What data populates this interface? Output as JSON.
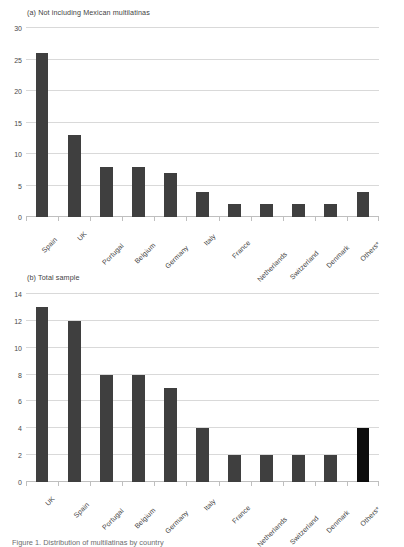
{
  "figure": {
    "caption_partial": "Figure 1. Distribution of multilatinas by country"
  },
  "chart_data": [
    {
      "id": "a",
      "type": "bar",
      "title": "(a) Not including Mexican multilatinas",
      "xlabel": "",
      "ylabel": "",
      "categories": [
        "Spain",
        "UK",
        "Portugal",
        "Belgium",
        "Germany",
        "Italy",
        "France",
        "Netherlands",
        "Switzerland",
        "Denmark",
        "Others*"
      ],
      "values": [
        26,
        13,
        8,
        8,
        7,
        4,
        2,
        2,
        2,
        2,
        4
      ],
      "ylim": [
        0,
        30
      ],
      "yticks": [
        0,
        5,
        10,
        15,
        20,
        25,
        30
      ],
      "ytick_labels": [
        "0",
        "5",
        "10",
        "15",
        "20",
        "25",
        "30"
      ],
      "grid": true,
      "legend": "none",
      "bar_color": "#3f3f3f",
      "highlight_color": "#0d0d0d",
      "highlight_index": -1
    },
    {
      "id": "b",
      "type": "bar",
      "title": "(b) Total sample",
      "xlabel": "",
      "ylabel": "",
      "categories": [
        "UK",
        "Spain",
        "Portugal",
        "Belgium",
        "Germany",
        "Italy",
        "France",
        "Netherlands",
        "Switzerland",
        "Denmark",
        "Others*"
      ],
      "values": [
        13,
        12,
        8,
        8,
        7,
        4,
        2,
        2,
        2,
        2,
        4
      ],
      "ylim": [
        0,
        14
      ],
      "yticks": [
        0,
        2,
        4,
        6,
        8,
        10,
        12,
        14
      ],
      "ytick_labels": [
        "0",
        "2",
        "4",
        "6",
        "8",
        "10",
        "12",
        "14"
      ],
      "grid": true,
      "legend": "none",
      "bar_color": "#3f3f3f",
      "highlight_color": "#0d0d0d",
      "highlight_index": 10
    }
  ]
}
